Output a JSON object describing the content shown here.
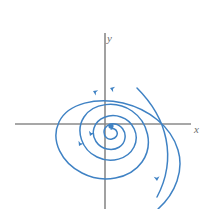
{
  "figure": {
    "name": "phase-portrait",
    "kind": "phase-plane-trajectory"
  },
  "axes": {
    "x_label": "x",
    "y_label": "y",
    "color": "#8a8a8a",
    "origin": {
      "x": 105,
      "y": 124
    },
    "x_axis": {
      "x1": 15,
      "y1": 124,
      "x2": 191,
      "y2": 124
    },
    "y_axis": {
      "x1": 105,
      "y1": 33,
      "x2": 105,
      "y2": 209
    },
    "x_label_pos": {
      "x": 194,
      "y": 133
    },
    "y_label_pos": {
      "x": 107,
      "y": 42
    }
  },
  "trajectory": {
    "color": "#3f82c4",
    "stroke_width": 1.5,
    "type": "spiral-sink",
    "rotation_deg": -40,
    "direction": "inward-clockwise",
    "path": "M 158 209 C 176 193 184 170 178 150 C 171 126 148 109 123 103 C 97 97 68 103 59 122 C 50 141 62 163 82 173 C 103 184 130 179 142 162 C 154 145 148 122 132 111 C 116 100 93 103 84 117 C 75 131 82 150 97 157 C 111 164 128 159 134 147 C 140 135 133 121 121 117 C 110 113 97 118 94 128 C 91 138 98 147 107 149 C 116 151 124 146 125 138 C 126 131 121 125 115 124 C 109 123 104 127 104 132 C 104 137 108 140 112 139 C 116 138 118 135 117 132 C 116 129 113 128 111 129",
    "lead_in_path": "M 137 88 C 151 102 162 119 166 139 C 170 159 166 180 157 197",
    "arrows": [
      {
        "name": "arrow-upper-inner",
        "x": 110,
        "y": 88,
        "angle": 200
      },
      {
        "name": "arrow-mid-upper",
        "x": 93,
        "y": 91,
        "angle": 205
      },
      {
        "name": "arrow-left-lower",
        "x": 79,
        "y": 146,
        "angle": 118
      },
      {
        "name": "arrow-lower-mid",
        "x": 90,
        "y": 136,
        "angle": 112
      },
      {
        "name": "arrow-outer-right",
        "x": 157,
        "y": 181,
        "angle": 85
      }
    ]
  }
}
